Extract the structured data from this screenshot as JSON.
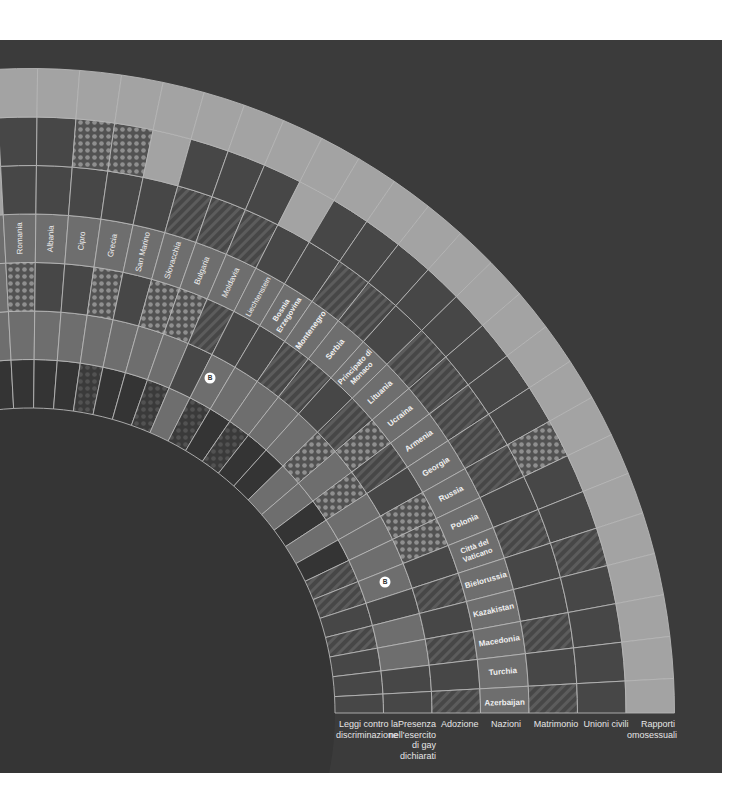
{
  "chart_data": {
    "type": "radial-heatmap",
    "title": "",
    "center": [
      30,
      713
    ],
    "inner_radius": 305,
    "ring_width": 48.5,
    "angle_start_deg": 91.2,
    "angle_step_deg": 3.75,
    "rings": [
      {
        "key": "discriminazione",
        "label": "Leggi contro la discriminazione"
      },
      {
        "key": "esercito",
        "label": "Presenza nell'esercito di gay dichiarati"
      },
      {
        "key": "adozione",
        "label": "Adozione"
      },
      {
        "key": "nazioni",
        "label": "Nazioni"
      },
      {
        "key": "matrimonio",
        "label": "Matrimonio"
      },
      {
        "key": "unioni",
        "label": "Unioni civili"
      },
      {
        "key": "rapporti",
        "label": "Rapporti omosessuali"
      }
    ],
    "legend_states": {
      "light": "#a3a3a3",
      "mid": "#6e6e6e",
      "dark": "#474747",
      "darker": "#343434",
      "stripes": "striped",
      "dots": "dotted",
      "dots_dark": "dotted-dark"
    },
    "countries": [
      {
        "name": "",
        "cells": [
          "darker",
          "mid",
          "mid",
          "mid",
          "light",
          "light",
          "light"
        ]
      },
      {
        "name": "Romania",
        "cells": [
          "darker",
          "mid",
          "dots",
          "mid",
          "dark",
          "dark",
          "light"
        ]
      },
      {
        "name": "Albania",
        "cells": [
          "darker",
          "mid",
          "dark",
          "mid",
          "dark",
          "dark",
          "light"
        ]
      },
      {
        "name": "Cipro",
        "cells": [
          "darker",
          "mid",
          "dark",
          "mid",
          "dark",
          "dots",
          "light"
        ]
      },
      {
        "name": "Grecia",
        "cells": [
          "dots_dark",
          "mid",
          "dots",
          "mid",
          "dark",
          "dots",
          "light"
        ]
      },
      {
        "name": "San Marino",
        "cells": [
          "darker",
          "mid",
          "dark",
          "mid",
          "dark",
          "light",
          "light"
        ]
      },
      {
        "name": "Slovacchia",
        "cells": [
          "darker",
          "mid",
          "dots",
          "mid",
          "stripes",
          "dark",
          "light"
        ]
      },
      {
        "name": "Bulgaria",
        "cells": [
          "dots_dark",
          "mid",
          "dots",
          "mid",
          "stripes",
          "dark",
          "light"
        ]
      },
      {
        "name": "Moldavia",
        "cells": [
          "mid",
          "dark",
          "stripes",
          "mid",
          "stripes",
          "dark",
          "light"
        ]
      },
      {
        "name": "Liechtenstein",
        "cells": [
          "dots_dark",
          "mid",
          "dark",
          "mid",
          "dark",
          "light",
          "light"
        ]
      },
      {
        "name": "Bosnia Erzegovina",
        "cells": [
          "darker",
          "mid",
          "dark",
          "mid",
          "dark",
          "dark",
          "light"
        ]
      },
      {
        "name": "Montenegro",
        "cells": [
          "dots_dark",
          "mid",
          "stripes",
          "mid",
          "stripes",
          "dark",
          "light"
        ]
      },
      {
        "name": "Serbia",
        "cells": [
          "darker",
          "mid",
          "stripes",
          "mid",
          "stripes",
          "dark",
          "light"
        ]
      },
      {
        "name": "Principato di Monaco",
        "cells": [
          "darker",
          "mid",
          "dark",
          "mid",
          "dark",
          "dark",
          "light"
        ]
      },
      {
        "name": "Lituania",
        "cells": [
          "mid",
          "dots",
          "stripes",
          "mid",
          "stripes",
          "dark",
          "light"
        ]
      },
      {
        "name": "Ucraina",
        "cells": [
          "mid",
          "mid",
          "dots",
          "mid",
          "stripes",
          "dark",
          "light"
        ]
      },
      {
        "name": "Armenia",
        "cells": [
          "darker",
          "dots",
          "stripes",
          "mid",
          "stripes",
          "dark",
          "light"
        ]
      },
      {
        "name": "Georgia",
        "cells": [
          "mid",
          "mid",
          "dark",
          "mid",
          "stripes",
          "dark",
          "light"
        ]
      },
      {
        "name": "Russia",
        "cells": [
          "darker",
          "mid",
          "dots",
          "mid",
          "stripes",
          "dots",
          "light"
        ]
      },
      {
        "name": "Polonia",
        "cells": [
          "stripes",
          "mid",
          "dots",
          "mid",
          "dark",
          "dark",
          "light"
        ]
      },
      {
        "name": "Città del Vaticano",
        "cells": [
          "stripes",
          "mid",
          "dark",
          "mid",
          "stripes",
          "dark",
          "light"
        ]
      },
      {
        "name": "Bielorussia",
        "cells": [
          "dark",
          "dark",
          "stripes",
          "mid",
          "dark",
          "stripes",
          "light"
        ]
      },
      {
        "name": "Kazakistan",
        "cells": [
          "stripes",
          "mid",
          "dark",
          "mid",
          "dark",
          "dark",
          "light"
        ]
      },
      {
        "name": "Macedonia",
        "cells": [
          "dark",
          "mid",
          "stripes",
          "mid",
          "stripes",
          "dark",
          "light"
        ]
      },
      {
        "name": "Turchia",
        "cells": [
          "dark",
          "dark",
          "dark",
          "mid",
          "dark",
          "dark",
          "light"
        ]
      },
      {
        "name": "Azerbaijan",
        "cells": [
          "dark",
          "dark",
          "stripes",
          "mid",
          "stripes",
          "dark",
          "light"
        ]
      }
    ],
    "markers": [
      {
        "label": "B",
        "x": 210,
        "y": 378
      },
      {
        "label": "B",
        "x": 385,
        "y": 582
      }
    ]
  },
  "legend": {
    "discriminazione": "Leggi contro la discriminazione",
    "esercito": "Presenza nell'esercito di gay dichiarati",
    "adozione": "Adozione",
    "nazioni": "Nazioni",
    "matrimonio": "Matrimonio",
    "unioni": "Unioni civili",
    "rapporti": "Rapporti omosessuali"
  }
}
